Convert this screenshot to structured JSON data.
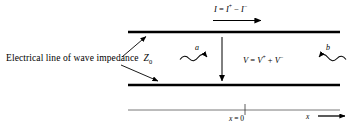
{
  "figure": {
    "background_color": "#ffffff",
    "line_color": "#000000",
    "width": 358,
    "height": 132
  },
  "labels": {
    "line_description_text": "Electrical line of wave impedance",
    "line_description_symbol": "Z",
    "line_description_subscript": "0",
    "current_label": "I",
    "current_equals": " = ",
    "current_term_1": "I",
    "current_term_1_sup": "+",
    "current_operator": " − ",
    "current_term_2": "I",
    "current_term_2_sup": "−",
    "voltage_label": "V",
    "voltage_equals": " = ",
    "voltage_term_1": "V",
    "voltage_term_1_sup": "+",
    "voltage_operator": " + ",
    "voltage_term_2": "V",
    "voltage_term_2_sup": "−",
    "incident_wave": "a",
    "reflected_wave": "b",
    "origin_symbol": "x",
    "origin_equals": " = ",
    "origin_value": "0",
    "axis_label": "x"
  },
  "geometry": {
    "top_conductor": {
      "x1": 128,
      "y1": 32,
      "x2": 340,
      "y2": 32,
      "stroke_width": 2.4
    },
    "bottom_conductor": {
      "x1": 128,
      "y1": 85,
      "x2": 340,
      "y2": 85,
      "stroke_width": 2.4
    },
    "x_axis": {
      "x1": 128,
      "y1": 110,
      "x2": 348,
      "y2": 110,
      "stroke_width": 0.8
    },
    "x_axis_tick": {
      "x": 245,
      "y1": 104,
      "y2": 115
    },
    "current_arrow": {
      "x1": 213,
      "y1": 21,
      "x2": 262,
      "y2": 21
    },
    "voltage_arrow": {
      "x": 222,
      "y1": 38,
      "x2": 222,
      "y2": 82
    },
    "leader_top": {
      "x1": 123,
      "y1": 56,
      "x2": 147,
      "y2": 36
    },
    "leader_bottom": {
      "x1": 123,
      "y1": 66,
      "x2": 160,
      "y2": 82
    },
    "wave_a": {
      "x1": 180,
      "y1": 58,
      "x2": 214,
      "y2": 58,
      "direction": "right"
    },
    "wave_b": {
      "x1": 312,
      "y1": 58,
      "x2": 346,
      "y2": 58,
      "direction": "left"
    }
  }
}
